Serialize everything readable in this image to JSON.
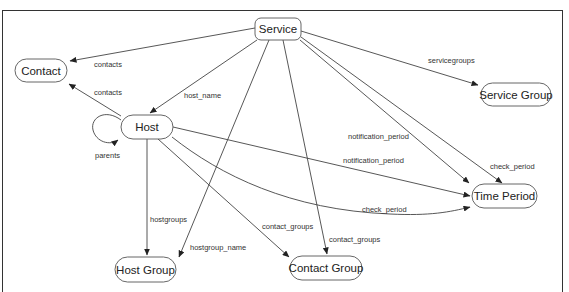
{
  "diagram": {
    "nodes": [
      {
        "id": "service",
        "label": "Service",
        "x": 255,
        "y": 18,
        "w": 46,
        "h": 22
      },
      {
        "id": "contact",
        "label": "Contact",
        "x": 15,
        "y": 59,
        "w": 52,
        "h": 23
      },
      {
        "id": "service_group",
        "label": "Service Group",
        "x": 481,
        "y": 83,
        "w": 70,
        "h": 23
      },
      {
        "id": "host",
        "label": "Host",
        "x": 121,
        "y": 115,
        "w": 52,
        "h": 24
      },
      {
        "id": "time_period",
        "label": "Time Period",
        "x": 472,
        "y": 184,
        "w": 65,
        "h": 24
      },
      {
        "id": "host_group",
        "label": "Host Group",
        "x": 115,
        "y": 257,
        "w": 61,
        "h": 25
      },
      {
        "id": "contact_group",
        "label": "Contact Group",
        "x": 290,
        "y": 256,
        "w": 72,
        "h": 24
      }
    ],
    "edges": [
      {
        "from": "service",
        "to": "contact",
        "label": "contacts"
      },
      {
        "from": "host",
        "to": "contact",
        "label": "contacts"
      },
      {
        "from": "service",
        "to": "host",
        "label": "host_name"
      },
      {
        "from": "service",
        "to": "service_group",
        "label": "servicegroups"
      },
      {
        "from": "host",
        "to": "host",
        "label": "parents"
      },
      {
        "from": "service",
        "to": "time_period",
        "label": "notification_period"
      },
      {
        "from": "host",
        "to": "time_period",
        "label": "notification_period"
      },
      {
        "from": "service",
        "to": "time_period",
        "label": "check_period"
      },
      {
        "from": "host",
        "to": "time_period",
        "label": "check_period"
      },
      {
        "from": "host",
        "to": "host_group",
        "label": "hostgroups"
      },
      {
        "from": "service",
        "to": "host_group",
        "label": "hostgroup_name"
      },
      {
        "from": "host",
        "to": "contact_group",
        "label": "contact_groups"
      },
      {
        "from": "service",
        "to": "contact_group",
        "label": "contact_groups"
      }
    ]
  }
}
